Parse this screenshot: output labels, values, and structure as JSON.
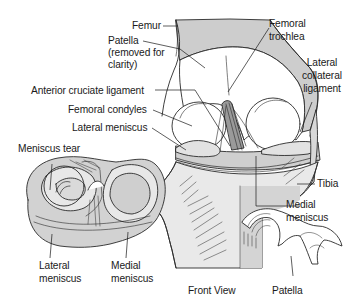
{
  "figure": {
    "views": {
      "front": {
        "caption": "Front View"
      },
      "top": {
        "caption": ""
      }
    },
    "colors": {
      "line": "#2a2a2a",
      "shade": "#c9c9c9",
      "light_shade": "#e4e4e4",
      "background": "#ffffff"
    }
  },
  "labels": {
    "femur": "Femur",
    "patella_removed_1": "Patella",
    "patella_removed_2": "(removed for",
    "patella_removed_3": "clarity)",
    "acl": "Anterior cruciate ligament",
    "femoral_condyles": "Femoral condylles",
    "lateral_meniscus_front": "Lateral meniscus",
    "meniscus_tear": "Meniscus tear",
    "femoral_trochlea_1": "Femoral",
    "femoral_trochlea_2": "trochlea",
    "lcl_1": "Lateral",
    "lcl_2": "collateral",
    "lcl_3": "ligament",
    "tibia": "Tibia",
    "medial_meniscus_front_1": "Medial",
    "medial_meniscus_front_2": "meniscus",
    "lateral_meniscus_top_1": "Lateral",
    "lateral_meniscus_top_2": "meniscus",
    "medial_meniscus_top_1": "Medial",
    "medial_meniscus_top_2": "meniscus",
    "front_view": "Front View",
    "patella": "Patella"
  }
}
